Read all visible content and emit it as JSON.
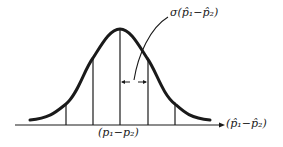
{
  "diagram": {
    "type": "normal-distribution",
    "labels": {
      "sigma": "σ(p̂₁−p̂₂)",
      "axis": "(p̂₁−p̂₂)",
      "mean": "(p₁−p₂)"
    },
    "colors": {
      "curve": "#1a1a1a",
      "lines": "#1a1a1a",
      "background": "#ffffff"
    }
  }
}
